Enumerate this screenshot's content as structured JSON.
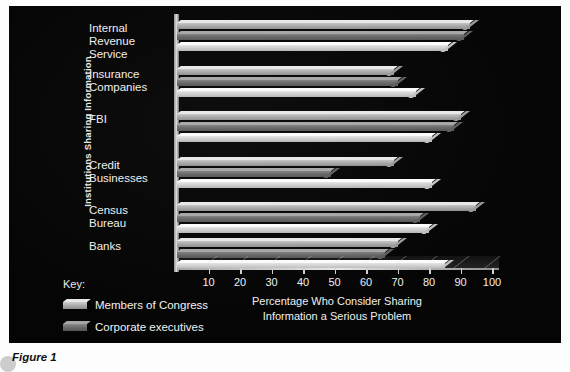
{
  "figure_caption": "Figure 1",
  "axis": {
    "y_title": "Institutions Sharing Information",
    "x_title_line1": "Percentage Who Consider Sharing",
    "x_title_line2": "Information a Serious Problem"
  },
  "key": {
    "heading": "Key:",
    "items": [
      {
        "label": "Members of Congress",
        "color": "#b4b4b4"
      },
      {
        "label": "Corporate executives",
        "color": "#6b6b6b"
      },
      {
        "label": "School superintendents",
        "color": "#dcdcdc"
      }
    ]
  },
  "chart_data": {
    "type": "bar",
    "orientation": "horizontal",
    "title": "",
    "xlabel": "Percentage Who Consider Sharing Information a Serious Problem",
    "ylabel": "Institutions Sharing Information",
    "xlim": [
      0,
      100
    ],
    "xticks": [
      10,
      20,
      30,
      40,
      50,
      60,
      70,
      80,
      90,
      100
    ],
    "grid": false,
    "legend_position": "bottom-left",
    "categories": [
      "Internal\nRevenue\nService",
      "Insurance\nCompanies",
      "FBI",
      "Credit\nBusinesses",
      "Census\nBureau",
      "Banks"
    ],
    "series": [
      {
        "name": "Members of Congress",
        "color": "#b4b4b4",
        "values": [
          93,
          69,
          90,
          69,
          95,
          70
        ]
      },
      {
        "name": "Corporate executives",
        "color": "#6b6b6b",
        "values": [
          91,
          70,
          88,
          49,
          77,
          66
        ]
      },
      {
        "name": "School superintendents",
        "color": "#dcdcdc",
        "values": [
          86,
          76,
          81,
          81,
          80,
          85
        ]
      }
    ]
  }
}
